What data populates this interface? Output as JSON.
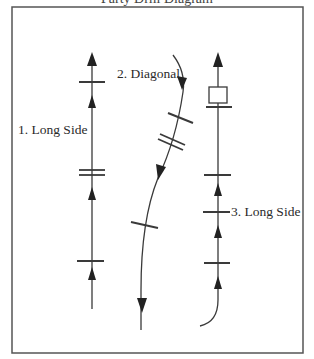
{
  "title_partial": "Party Drill Diagram",
  "diagram": {
    "paths": [
      {
        "id": 1,
        "label": "1. Long Side"
      },
      {
        "id": 2,
        "label": "2. Diagonal"
      },
      {
        "id": 3,
        "label": "3. Long Side"
      }
    ],
    "colors": {
      "line": "#3a3a3a",
      "frame": "#555555",
      "background": "#ffffff"
    }
  }
}
